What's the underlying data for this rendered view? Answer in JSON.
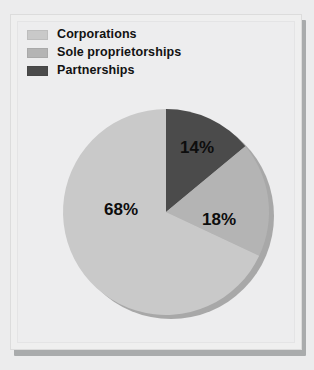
{
  "figure": {
    "background_color": "#ececed",
    "panel_color": "#efefef",
    "panel_border_color": "#dcdcdc",
    "panel_shadow_color": "#a9abac"
  },
  "legend": {
    "position": "top-left",
    "items": [
      {
        "label": "Corporations",
        "color": "#c9c9c9",
        "swatch_name": "legend-swatch-corporations"
      },
      {
        "label": "Sole proprietorships",
        "color": "#b4b4b4",
        "swatch_name": "legend-swatch-sole-proprietorships"
      },
      {
        "label": "Partnerships",
        "color": "#4b4b4b",
        "swatch_name": "legend-swatch-partnerships"
      }
    ]
  },
  "chart_data": {
    "type": "pie",
    "title": "",
    "subtitle": "",
    "xlabel": "",
    "ylabel": "",
    "grid": false,
    "legend_position": "top-left",
    "start_angle_deg": 0,
    "direction": "clockwise",
    "units": "percent",
    "categories": [
      "Partnerships",
      "Sole proprietorships",
      "Corporations"
    ],
    "values": [
      14,
      18,
      68
    ],
    "slices": [
      {
        "name": "Partnerships",
        "value": 14,
        "label": "14%",
        "color": "#4b4b4b",
        "start_deg": 0,
        "end_deg": 50.4,
        "label_x": 186,
        "label_y": 134
      },
      {
        "name": "Sole proprietorships",
        "value": 18,
        "label": "18%",
        "color": "#b4b4b4",
        "start_deg": 50.4,
        "end_deg": 115.2,
        "label_x": 208,
        "label_y": 206
      },
      {
        "name": "Corporations",
        "value": 68,
        "label": "68%",
        "color": "#c9c9c9",
        "start_deg": 115.2,
        "end_deg": 360,
        "label_x": 110,
        "label_y": 196
      }
    ],
    "geometry": {
      "center_x": 155,
      "center_y": 197,
      "radius": 103,
      "shadow_color": "#a8a8a8",
      "shadow_offset_x": 5,
      "shadow_offset_y": 4
    }
  }
}
